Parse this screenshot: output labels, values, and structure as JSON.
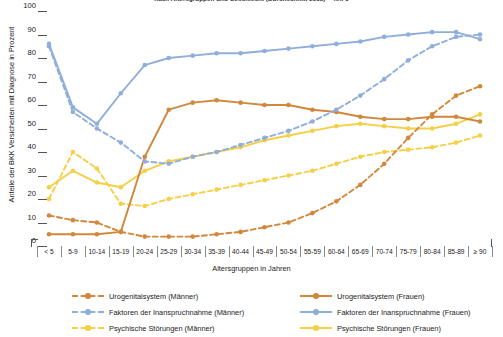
{
  "chart_data": {
    "type": "line",
    "title": "nach Altersgruppen und Geschlecht (Durchschnitt 2013) – Teil 1",
    "xlabel": "Altersgruppen in Jahren",
    "ylabel": "Anteile der BKK Versicherten mit Diagnose in Prozent",
    "ylim": [
      0,
      100
    ],
    "ytick_values": [
      100,
      90,
      80,
      70,
      60,
      50,
      40,
      30,
      20,
      10,
      0
    ],
    "grid": false,
    "legend_position": "bottom",
    "categories": [
      "< 5",
      "5-9",
      "10-14",
      "15-19",
      "20-24",
      "25-29",
      "30-34",
      "35-39",
      "40-44",
      "45-49",
      "50-54",
      "55-59",
      "60-64",
      "65-69",
      "70-74",
      "75-79",
      "80-84",
      "85-89",
      "≥ 90"
    ],
    "series": [
      {
        "name": "Urogenitalsystem (Männer)",
        "color": "#D2873A",
        "style": "dashed",
        "values": [
          13,
          11,
          10,
          6,
          4,
          4,
          4,
          5,
          6,
          8,
          10,
          14,
          19,
          26,
          35,
          46,
          56,
          64,
          68
        ]
      },
      {
        "name": "Urogenitalsystem (Frauen)",
        "color": "#D2873A",
        "style": "solid",
        "values": [
          5,
          5,
          5,
          6,
          38,
          58,
          61,
          62,
          61,
          60,
          60,
          58,
          57,
          55,
          54,
          54,
          55,
          55,
          53
        ]
      },
      {
        "name": "Faktoren der Inanspruchnahme (Männer)",
        "color": "#8FAEDB",
        "style": "dashed",
        "values": [
          85,
          57,
          50,
          44,
          36,
          35,
          38,
          40,
          43,
          46,
          49,
          53,
          58,
          64,
          71,
          79,
          85,
          89,
          90
        ]
      },
      {
        "name": "Faktoren der Inanspruchnahme (Frauen)",
        "color": "#8FAEDB",
        "style": "solid",
        "values": [
          86,
          59,
          52,
          65,
          77,
          80,
          81,
          82,
          82,
          83,
          84,
          85,
          86,
          87,
          89,
          90,
          91,
          91,
          88
        ]
      },
      {
        "name": "Psychische Störungen (Männer)",
        "color": "#F5CF47",
        "style": "dashed",
        "values": [
          20,
          40,
          33,
          18,
          17,
          20,
          22,
          24,
          26,
          28,
          30,
          32,
          35,
          38,
          40,
          41,
          42,
          44,
          47
        ]
      },
      {
        "name": "Psychische Störungen (Frauen)",
        "color": "#F5CF47",
        "style": "solid",
        "values": [
          25,
          32,
          27,
          25,
          32,
          36,
          38,
          40,
          42,
          45,
          47,
          49,
          51,
          52,
          51,
          50,
          50,
          52,
          56
        ]
      }
    ]
  },
  "legend": {
    "left_column": [
      {
        "label": "Urogenitalsystem (Männer)",
        "color": "#D2873A",
        "style": "dashed"
      },
      {
        "label": "Faktoren der Inanspruchnahme (Männer)",
        "color": "#8FAEDB",
        "style": "dashed"
      },
      {
        "label": "Psychische Störungen (Männer)",
        "color": "#F5CF47",
        "style": "dashed"
      }
    ],
    "right_column": [
      {
        "label": "Urogenitalsystem (Frauen)",
        "color": "#D2873A",
        "style": "solid"
      },
      {
        "label": "Faktoren der Inanspruchnahme (Frauen)",
        "color": "#8FAEDB",
        "style": "solid"
      },
      {
        "label": "Psychische Störungen (Frauen)",
        "color": "#F5CF47",
        "style": "solid"
      }
    ]
  }
}
